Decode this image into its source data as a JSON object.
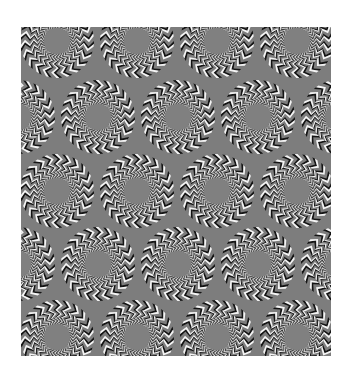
{
  "canvas": {
    "width": 352,
    "height": 380,
    "background": "#ffffff"
  },
  "illusion": {
    "type": "rotating-snakes-optical-illusion",
    "area": {
      "x": 21,
      "y": 27,
      "width": 310,
      "height": 329
    },
    "colors": {
      "field": "#7d7d7d",
      "dark": "#141414",
      "light": "#f4f4f4",
      "hole": "#808080"
    },
    "disc": {
      "outer_radius": 37,
      "hole_radius": 13,
      "rings": [
        {
          "r_in": 27,
          "r_out": 37,
          "segments": 22,
          "twist": 0.17
        },
        {
          "r_in": 19.5,
          "r_out": 27,
          "segments": 26,
          "twist": 0.2
        },
        {
          "r_in": 13,
          "r_out": 19.5,
          "segments": 32,
          "twist": 0.24
        }
      ]
    },
    "grid": {
      "row_centers_y": [
        41,
        117,
        191,
        264,
        337
      ],
      "even_row_centers_x": [
        57,
        137,
        217,
        297
      ],
      "odd_row_centers_x": [
        18,
        98,
        178,
        258,
        338
      ]
    }
  }
}
